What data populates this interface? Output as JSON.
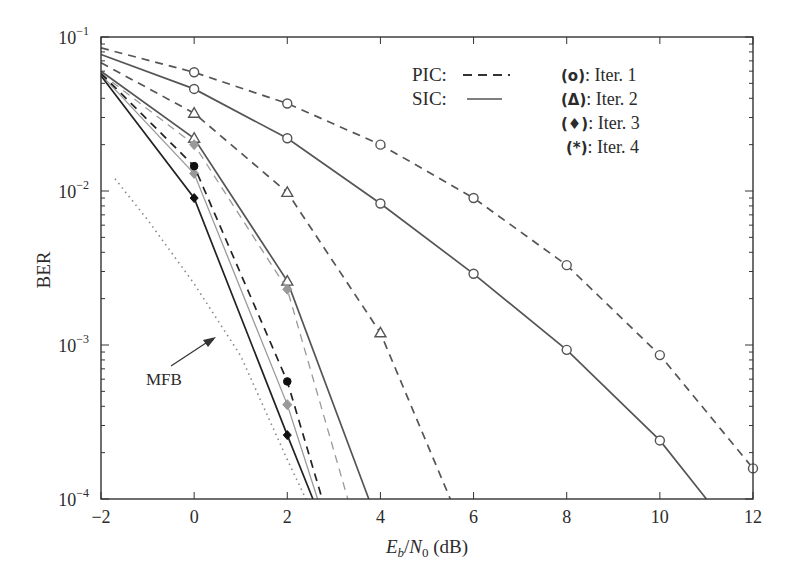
{
  "chart_data": {
    "type": "line",
    "title": "",
    "xlabel": "Eb/N0 (dB)",
    "xlabel_parts": {
      "E": "E",
      "b": "b",
      "slash": "/",
      "N": "N",
      "zero": "0",
      "unit": " (dB)"
    },
    "ylabel": "BER",
    "xlim": [
      -2,
      12
    ],
    "ylim": [
      0.0001,
      0.1
    ],
    "yscale": "log",
    "x_ticks": [
      "-2",
      "0",
      "2",
      "4",
      "6",
      "8",
      "10",
      "12"
    ],
    "y_ticks": [
      {
        "base": "10",
        "exp": "−1",
        "value": 0.1
      },
      {
        "base": "10",
        "exp": "−2",
        "value": 0.01
      },
      {
        "base": "10",
        "exp": "−3",
        "value": 0.001
      },
      {
        "base": "10",
        "exp": "−4",
        "value": 0.0001
      }
    ],
    "grid": false,
    "legend": {
      "line_styles": [
        {
          "label": "PIC:",
          "style": "dashed"
        },
        {
          "label": "SIC:",
          "style": "solid"
        }
      ],
      "markers": [
        {
          "symbol": "(o)",
          "label": ": Iter. 1"
        },
        {
          "symbol": "(Δ)",
          "label": ": Iter. 2"
        },
        {
          "symbol": "(♦)",
          "label": ": Iter. 3"
        },
        {
          "symbol": "(*)",
          "label": ": Iter. 4"
        }
      ],
      "position": "upper right"
    },
    "annotations": [
      {
        "text": "MFB",
        "arrow_to": [
          0.6,
          0.0011
        ]
      }
    ],
    "series": [
      {
        "name": "PIC Iter. 1",
        "style": "dashed",
        "color": "#555555",
        "marker": "circle",
        "x": [
          -2,
          0,
          2,
          4,
          6,
          8,
          10,
          12
        ],
        "y": [
          0.085,
          0.059,
          0.037,
          0.02,
          0.009,
          0.0033,
          0.00086,
          0.000158
        ]
      },
      {
        "name": "SIC Iter. 1",
        "style": "solid",
        "color": "#555555",
        "marker": "circle",
        "x": [
          -2,
          0,
          2,
          4,
          6,
          8,
          10,
          11
        ],
        "y": [
          0.077,
          0.046,
          0.022,
          0.0083,
          0.0029,
          0.00093,
          0.00024,
          0.0001
        ]
      },
      {
        "name": "PIC Iter. 2",
        "style": "dashed",
        "color": "#555555",
        "marker": "triangle",
        "x": [
          -2,
          0,
          2,
          4,
          5.5
        ],
        "y": [
          0.068,
          0.032,
          0.0098,
          0.0012,
          0.0001
        ]
      },
      {
        "name": "SIC Iter. 2",
        "style": "solid",
        "color": "#555555",
        "marker": "triangle",
        "x": [
          -2,
          0,
          2,
          3.75
        ],
        "y": [
          0.06,
          0.022,
          0.0026,
          0.0001
        ]
      },
      {
        "name": "PIC Iter. 3",
        "style": "dashed",
        "color": "#9a9a9a",
        "marker": "diamond-grey",
        "x": [
          -2,
          0,
          2,
          3.3
        ],
        "y": [
          0.058,
          0.02,
          0.0023,
          0.0001
        ]
      },
      {
        "name": "SIC Iter. 3",
        "style": "solid",
        "color": "#9a9a9a",
        "marker": "diamond-grey",
        "x": [
          -2,
          0,
          2,
          2.65
        ],
        "y": [
          0.057,
          0.013,
          0.00041,
          0.0001
        ]
      },
      {
        "name": "PIC Iter. 4",
        "style": "dashed",
        "color": "#222222",
        "marker": "star",
        "x": [
          -2,
          0,
          2,
          2.75
        ],
        "y": [
          0.058,
          0.0145,
          0.00058,
          0.0001
        ]
      },
      {
        "name": "SIC Iter. 4",
        "style": "solid",
        "color": "#222222",
        "marker": "diamond",
        "x": [
          -2,
          0,
          2,
          2.55
        ],
        "y": [
          0.056,
          0.009,
          0.00026,
          0.0001
        ]
      },
      {
        "name": "MFB",
        "style": "dotted",
        "color": "#888888",
        "marker": "none",
        "x": [
          -1.7,
          -1,
          0,
          1,
          2,
          2.4
        ],
        "y": [
          0.012,
          0.0065,
          0.0025,
          0.00085,
          0.00018,
          0.0001
        ]
      }
    ]
  }
}
